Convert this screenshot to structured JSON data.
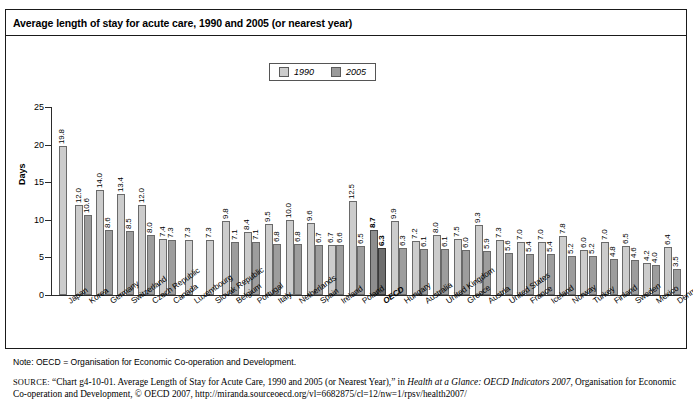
{
  "figure": {
    "title": "Average length of stay for acute care, 1990 and 2005 (or nearest year)",
    "note": "Note: OECD = Organisation for Economic Co-operation and Development.",
    "source_label": "SOURCE:",
    "source_part1": "“Chart g4-10-01. Average Length of Stay for Acute Care, 1990 and 2005 (or Nearest Year),” in ",
    "source_italic": "Health at a Glance: OECD Indicators 2007",
    "source_part2": ", Organisation for Economic Co-operation and Development, © OECD 2007, http://miranda.sourceoecd.org/vl=6682875/cl=12/nw=1/rpsv/health2007/"
  },
  "legend": {
    "position": "top-center",
    "items": [
      {
        "label": "1990",
        "color": "#cccccc"
      },
      {
        "label": "2005",
        "color": "#9d9d9d"
      }
    ]
  },
  "colors": {
    "bar_1990": "#cccccc",
    "bar_2005": "#9d9d9d",
    "bar_1990_highlight": "#8e8e8e",
    "bar_2005_highlight": "#6e6e6e",
    "axis": "#2b2b2b",
    "frame": "#1a1a1a"
  },
  "chart_data": {
    "type": "bar",
    "title": "Average length of stay for acute care, 1990 and 2005 (or nearest year)",
    "xlabel": "",
    "ylabel": "Days",
    "ylim": [
      0,
      25
    ],
    "yticks": [
      0,
      5,
      10,
      15,
      20,
      25
    ],
    "grid": false,
    "legend_position": "top-center",
    "highlight_category": "OECD",
    "categories": [
      "Japan",
      "Korea",
      "Germany",
      "Switzerland",
      "Czech Republic",
      "Canada",
      "Luxembourg",
      "Slovak Republic",
      "Belgium",
      "Portugal",
      "Italy",
      "Netherlands",
      "Spain",
      "Ireland",
      "Poland",
      "OECD",
      "Hungary",
      "Australia",
      "United Kingdom",
      "Greece",
      "Austria",
      "United States",
      "France",
      "Iceland",
      "Norway",
      "Turkey",
      "Finland",
      "Sweden",
      "Mexico",
      "Denmark"
    ],
    "series": [
      {
        "name": "1990",
        "values": [
          19.8,
          12.0,
          14.0,
          13.4,
          12.0,
          7.4,
          7.3,
          7.3,
          9.8,
          8.4,
          9.5,
          10.0,
          9.6,
          6.7,
          12.5,
          8.7,
          9.9,
          7.2,
          8.0,
          7.5,
          9.3,
          7.3,
          7.0,
          7.0,
          7.8,
          6.0,
          7.0,
          6.5,
          4.2,
          6.4
        ]
      },
      {
        "name": "2005",
        "values": [
          null,
          10.6,
          8.6,
          8.5,
          8.0,
          7.3,
          null,
          null,
          7.1,
          7.1,
          6.8,
          6.8,
          6.7,
          6.6,
          6.5,
          6.3,
          6.3,
          6.1,
          6.1,
          6.0,
          5.9,
          5.6,
          5.4,
          5.4,
          5.2,
          5.2,
          4.8,
          4.6,
          4.0,
          3.5
        ]
      }
    ]
  }
}
